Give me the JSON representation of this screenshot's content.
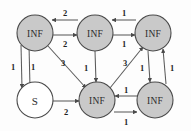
{
  "diagram": {
    "type": "graph",
    "node_fill_inf": "#c9c9c9",
    "node_fill_source": "#ffffff",
    "node_stroke": "#4a4a4a",
    "edge_color": "#5b5b5b",
    "label_color": "#1f1f1f",
    "background": "#fdfdfd",
    "nodes": [
      {
        "id": "n0",
        "label": "INF",
        "x": 35,
        "y": 33,
        "r": 18,
        "kind": "inf"
      },
      {
        "id": "n1",
        "label": "INF",
        "x": 95,
        "y": 33,
        "r": 18,
        "kind": "inf"
      },
      {
        "id": "n2",
        "label": "INF",
        "x": 153,
        "y": 33,
        "r": 18,
        "kind": "inf"
      },
      {
        "id": "n3",
        "label": "S",
        "x": 35,
        "y": 100,
        "r": 18,
        "kind": "source"
      },
      {
        "id": "n4",
        "label": "INF",
        "x": 97,
        "y": 100,
        "r": 18,
        "kind": "inf"
      },
      {
        "id": "n5",
        "label": "INF",
        "x": 155,
        "y": 100,
        "r": 18,
        "kind": "inf"
      }
    ],
    "edges": [
      {
        "id": "e0",
        "from": "n1",
        "to": "n0",
        "weight": "2",
        "wx": 65,
        "wy": 13,
        "x1": 78,
        "y1": 20,
        "x2": 52,
        "y2": 20
      },
      {
        "id": "e1",
        "from": "n0",
        "to": "n1",
        "weight": "2",
        "wx": 65,
        "wy": 44,
        "x1": 53,
        "y1": 35,
        "x2": 77,
        "y2": 35
      },
      {
        "id": "e2",
        "from": "n2",
        "to": "n1",
        "weight": "1",
        "wx": 124,
        "wy": 13,
        "x1": 136,
        "y1": 20,
        "x2": 112,
        "y2": 20
      },
      {
        "id": "e3",
        "from": "n1",
        "to": "n2",
        "weight": "1",
        "wx": 124,
        "wy": 44,
        "x1": 113,
        "y1": 35,
        "x2": 135,
        "y2": 35
      },
      {
        "id": "e4",
        "from": "n0",
        "to": "n3",
        "weight": "1",
        "wx": 13,
        "wy": 67,
        "x1": 21,
        "y1": 45,
        "x2": 22,
        "y2": 88
      },
      {
        "id": "e5",
        "from": "n3",
        "to": "n0",
        "weight": "1",
        "wx": 33,
        "wy": 67,
        "x1": 30,
        "y1": 88,
        "x2": 29,
        "y2": 45
      },
      {
        "id": "e6",
        "from": "n0",
        "to": "n4",
        "weight": "3",
        "wx": 63,
        "wy": 63,
        "x1": 48,
        "y1": 46,
        "x2": 86,
        "y2": 88
      },
      {
        "id": "e7",
        "from": "n1",
        "to": "n4",
        "weight": "1",
        "wx": 86,
        "wy": 68,
        "x1": 95,
        "y1": 51,
        "x2": 96,
        "y2": 82
      },
      {
        "id": "e8",
        "from": "n4",
        "to": "n2",
        "weight": "3",
        "wx": 125,
        "wy": 63,
        "x1": 110,
        "y1": 88,
        "x2": 143,
        "y2": 47
      },
      {
        "id": "e9",
        "from": "n3",
        "to": "n4",
        "weight": "2",
        "wx": 66,
        "wy": 112,
        "x1": 53,
        "y1": 101,
        "x2": 79,
        "y2": 101
      },
      {
        "id": "e10",
        "from": "n5",
        "to": "n4",
        "weight": "1",
        "wx": 126,
        "wy": 90,
        "x1": 138,
        "y1": 96,
        "x2": 115,
        "y2": 96
      },
      {
        "id": "e11",
        "from": "n4",
        "to": "n5",
        "weight": "1",
        "wx": 126,
        "wy": 122,
        "x1": 114,
        "y1": 112,
        "x2": 137,
        "y2": 112
      },
      {
        "id": "e12",
        "from": "n2",
        "to": "n5",
        "weight": "1",
        "wx": 142,
        "wy": 68,
        "x1": 148,
        "y1": 51,
        "x2": 150,
        "y2": 82
      },
      {
        "id": "e13",
        "from": "n5",
        "to": "n2",
        "weight": "1",
        "wx": 172,
        "wy": 68,
        "x1": 166,
        "y1": 84,
        "x2": 163,
        "y2": 49
      }
    ]
  }
}
